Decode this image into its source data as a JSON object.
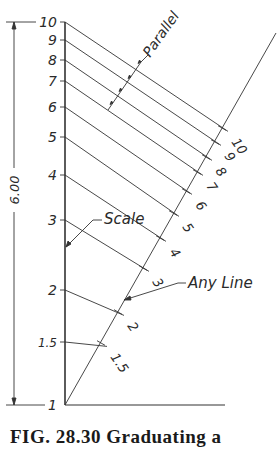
{
  "figure": {
    "caption": "FIG. 28.30   Graduating a",
    "dimension_label": "6.00",
    "labels": {
      "parallel": "Parallel",
      "scale": "Scale",
      "any_line": "Any Line"
    },
    "line_color": "#333333",
    "scale_ticks": [
      {
        "label": "10",
        "y": 22,
        "ax": 222,
        "ay": 128
      },
      {
        "label": "9",
        "y": 40,
        "ax": 215,
        "ay": 142
      },
      {
        "label": "8",
        "y": 60,
        "ax": 206,
        "ay": 157
      },
      {
        "label": "7",
        "y": 81,
        "ax": 197,
        "ay": 172
      },
      {
        "label": "6",
        "y": 107,
        "ax": 186,
        "ay": 191
      },
      {
        "label": "5",
        "y": 137,
        "ax": 173,
        "ay": 213
      },
      {
        "label": "4",
        "y": 175,
        "ax": 160,
        "ay": 238
      },
      {
        "label": "3",
        "y": 220,
        "ax": 143,
        "ay": 268
      },
      {
        "label": "2",
        "y": 290,
        "ax": 118,
        "ay": 312
      },
      {
        "label": "1.5",
        "y": 342,
        "ax": 101,
        "ay": 343
      },
      {
        "label": "1",
        "y": 405,
        "ax": 65,
        "ay": 405
      }
    ]
  }
}
